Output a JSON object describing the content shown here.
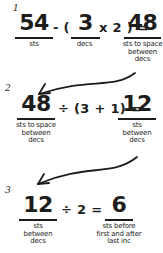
{
  "figure": {
    "background": "#ffffff",
    "ink": "#1d1d1b"
  },
  "steps": [
    {
      "number": "1",
      "terms": {
        "minuend": {
          "value": "54",
          "labels": [
            "sts"
          ]
        },
        "op_open": "- (",
        "subtrahend": {
          "value": "3",
          "labels": [
            "decs"
          ]
        },
        "op_close": "x 2 ) =",
        "result": {
          "value": "48",
          "labels": [
            "sts to space",
            "between",
            "decs"
          ]
        }
      }
    },
    {
      "number": "2",
      "terms": {
        "dividend": {
          "value": "48",
          "labels": [
            "sts to space",
            "between",
            "decs"
          ]
        },
        "op": "÷ (3 + 1) =",
        "result": {
          "value": "12",
          "labels": [
            "sts",
            "between",
            "decs"
          ]
        }
      }
    },
    {
      "number": "3",
      "terms": {
        "dividend": {
          "value": "12",
          "labels": [
            "sts",
            "between",
            "decs"
          ]
        },
        "op": "÷ 2 =",
        "result": {
          "value": "6",
          "labels": [
            "sts before",
            "first and after",
            "last inc"
          ]
        }
      }
    }
  ],
  "arrows": [
    "curved-arrow-step1-result-to-step2",
    "curved-arrow-step2-result-to-step3"
  ]
}
